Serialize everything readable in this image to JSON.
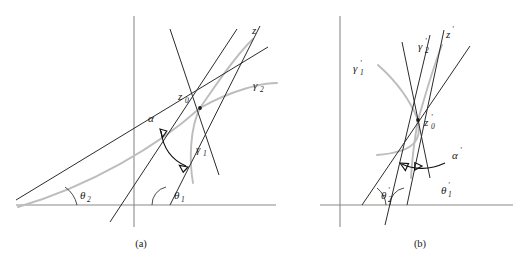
{
  "figure": {
    "background_color": "#ffffff",
    "ink_color": "#1a1a1a",
    "axis_color": "#8a8a8a",
    "curve_color": "#bdbdbd",
    "panels": [
      {
        "id": "a",
        "caption": "(a)",
        "intersection_label": {
          "base": "z",
          "sub": "0"
        },
        "angle_between_label": {
          "base": "α",
          "prime": ""
        },
        "curve_labels": [
          {
            "base": "γ",
            "sub": "1"
          },
          {
            "base": "γ",
            "sub": "2"
          }
        ],
        "axis_label": {
          "base": "z",
          "prime": ""
        },
        "theta_labels": [
          {
            "base": "θ",
            "sub": "1"
          },
          {
            "base": "θ",
            "sub": "2"
          }
        ]
      },
      {
        "id": "b",
        "caption": "(b)",
        "intersection_label": {
          "base": "z",
          "sub": "0",
          "prime": "′"
        },
        "angle_between_label": {
          "base": "α",
          "prime": "′"
        },
        "curve_labels": [
          {
            "base": "γ",
            "sub": "1",
            "prime": "′"
          },
          {
            "base": "γ",
            "sub": "2",
            "prime": "′"
          }
        ],
        "axis_label": {
          "base": "z",
          "prime": "′"
        },
        "theta_labels": [
          {
            "base": "θ",
            "sub": "1",
            "prime": "′"
          },
          {
            "base": "θ",
            "sub": "2",
            "prime": "′"
          }
        ]
      }
    ]
  },
  "labels": {
    "a": {
      "z0_base": "z",
      "z0_sub": "0",
      "alpha": "α",
      "gamma1_base": "γ",
      "gamma1_sub": "1",
      "gamma2_base": "γ",
      "gamma2_sub": "2",
      "z": "z",
      "theta1_base": "θ",
      "theta1_sub": "1",
      "theta2_base": "θ",
      "theta2_sub": "2",
      "caption": "(a)"
    },
    "b": {
      "z0_base": "z",
      "z0_sub": "0",
      "z0_prime": "′",
      "alpha": "α",
      "alpha_prime": "′",
      "gamma1_base": "γ",
      "gamma1_sub": "1",
      "gamma1_prime": "′",
      "gamma2_base": "γ",
      "gamma2_sub": "2",
      "gamma2_prime": "′",
      "z_base": "z",
      "z_prime": "′",
      "theta1_base": "θ",
      "theta1_sub": "1",
      "theta1_prime": "′",
      "theta2_base": "θ",
      "theta2_sub": "2",
      "theta2_prime": "′",
      "caption": "(b)"
    }
  }
}
